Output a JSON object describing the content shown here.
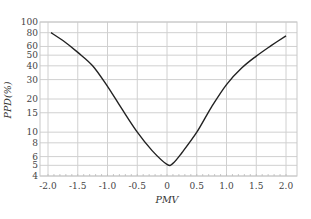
{
  "chart_data": {
    "type": "line",
    "title": "",
    "xlabel": "PMV",
    "ylabel": "PPD(%)",
    "xlim": [
      -2.0,
      2.0
    ],
    "ylim": [
      4,
      100
    ],
    "yscale": "log",
    "grid": true,
    "legend": null,
    "x_ticks": [
      {
        "value": -2.0,
        "label": "-2.0"
      },
      {
        "value": -1.5,
        "label": "-1.5"
      },
      {
        "value": -1.0,
        "label": "-1.0"
      },
      {
        "value": -0.5,
        "label": "-0.5"
      },
      {
        "value": 0,
        "label": "0"
      },
      {
        "value": 0.5,
        "label": "0.5"
      },
      {
        "value": 1.0,
        "label": "1.0"
      },
      {
        "value": 1.5,
        "label": "1.5"
      },
      {
        "value": 2.0,
        "label": "2.0"
      }
    ],
    "y_ticks": [
      {
        "value": 100,
        "label": "100"
      },
      {
        "value": 80,
        "label": "80"
      },
      {
        "value": 60,
        "label": "60"
      },
      {
        "value": 50,
        "label": "50"
      },
      {
        "value": 40,
        "label": "40"
      },
      {
        "value": 30,
        "label": "30"
      },
      {
        "value": 20,
        "label": "20"
      },
      {
        "value": 15,
        "label": "15"
      },
      {
        "value": 10,
        "label": "10"
      },
      {
        "value": 8,
        "label": "8"
      },
      {
        "value": 6,
        "label": "6"
      },
      {
        "value": 5,
        "label": "5"
      },
      {
        "value": 4,
        "label": "4"
      }
    ],
    "series": [
      {
        "name": "PPD",
        "x": [
          -1.95,
          -1.75,
          -1.5,
          -1.25,
          -1.0,
          -0.75,
          -0.5,
          -0.25,
          0,
          0.1,
          0.25,
          0.5,
          0.75,
          1.0,
          1.25,
          1.5,
          1.75,
          2.0
        ],
        "values": [
          80,
          68,
          53,
          40,
          26,
          16,
          10,
          6.8,
          5.1,
          5.2,
          6.5,
          10,
          17,
          27,
          38,
          49,
          61,
          75
        ]
      }
    ]
  },
  "colors": {
    "line": "#222222",
    "grid": "#d0d0d0",
    "border": "#c8c8c8",
    "text": "#444444"
  }
}
